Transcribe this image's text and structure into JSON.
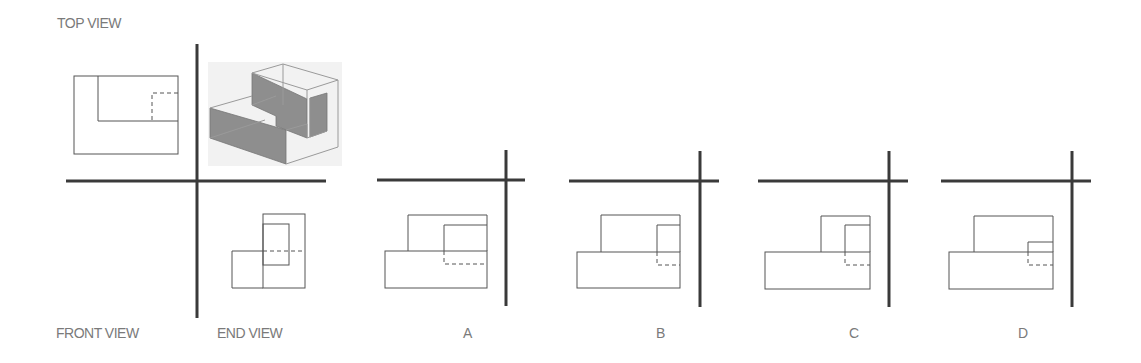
{
  "labels": {
    "top_view": "TOP VIEW",
    "front_view": "FRONT VIEW",
    "end_view": "END VIEW"
  },
  "options": [
    {
      "letter": "A"
    },
    {
      "letter": "B"
    },
    {
      "letter": "C"
    },
    {
      "letter": "D"
    }
  ],
  "colors": {
    "axis": "#3a3a3a",
    "line": "#555555",
    "label": "#7a7a7a",
    "shading": "#8e8e8e"
  }
}
